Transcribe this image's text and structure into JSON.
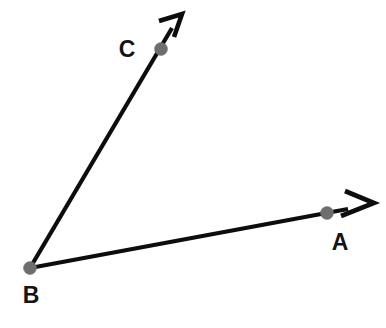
{
  "figure": {
    "background_color": "#ffffff",
    "line_color": "#0d0d0d",
    "point_color": "#6e6e6e",
    "label_color": "#141414",
    "vertex": "B",
    "rays": [
      {
        "name": "ray-BA",
        "from": "B",
        "through": "A",
        "start": {
          "x": 30,
          "y": 268
        },
        "point": {
          "x": 327,
          "y": 213
        },
        "tip": {
          "x": 374,
          "y": 203
        }
      },
      {
        "name": "ray-BC",
        "from": "B",
        "through": "C",
        "start": {
          "x": 30,
          "y": 268
        },
        "point": {
          "x": 161,
          "y": 49
        },
        "tip": {
          "x": 182,
          "y": 14
        }
      }
    ],
    "points": [
      {
        "label": "A",
        "dot": {
          "x": 327,
          "y": 213,
          "r": 6.5
        },
        "label_pos": {
          "x": 340,
          "y": 250
        }
      },
      {
        "label": "B",
        "dot": {
          "x": 30,
          "y": 268,
          "r": 6.5
        },
        "label_pos": {
          "x": 24,
          "y": 303
        }
      },
      {
        "label": "C",
        "dot": {
          "x": 161,
          "y": 49,
          "r": 6.5
        },
        "label_pos": {
          "x": 127,
          "y": 57
        }
      }
    ]
  }
}
